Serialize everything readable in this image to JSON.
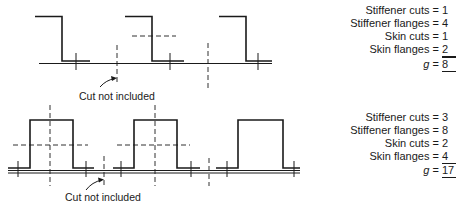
{
  "top_example": {
    "annotation": "Cut not included",
    "counts": [
      {
        "label": "Stiffener cuts",
        "value": "1"
      },
      {
        "label": "Stiffener flanges",
        "value": "4"
      },
      {
        "label": "Skin cuts",
        "value": "1"
      },
      {
        "label": "Skin flanges",
        "value": "2"
      }
    ],
    "total": {
      "label": "g",
      "value": "8"
    },
    "stiffener_shape": "Z-section",
    "stiffener_count": 3
  },
  "bottom_example": {
    "annotation": "Cut not included",
    "counts": [
      {
        "label": "Stiffener cuts",
        "value": "3"
      },
      {
        "label": "Stiffener flanges",
        "value": "8"
      },
      {
        "label": "Skin cuts",
        "value": "2"
      },
      {
        "label": "Skin flanges",
        "value": "4"
      }
    ],
    "total": {
      "label": "g",
      "value": "17"
    },
    "stiffener_shape": "hat-section",
    "stiffener_count": 3
  },
  "symbols": {
    "equals": "="
  }
}
